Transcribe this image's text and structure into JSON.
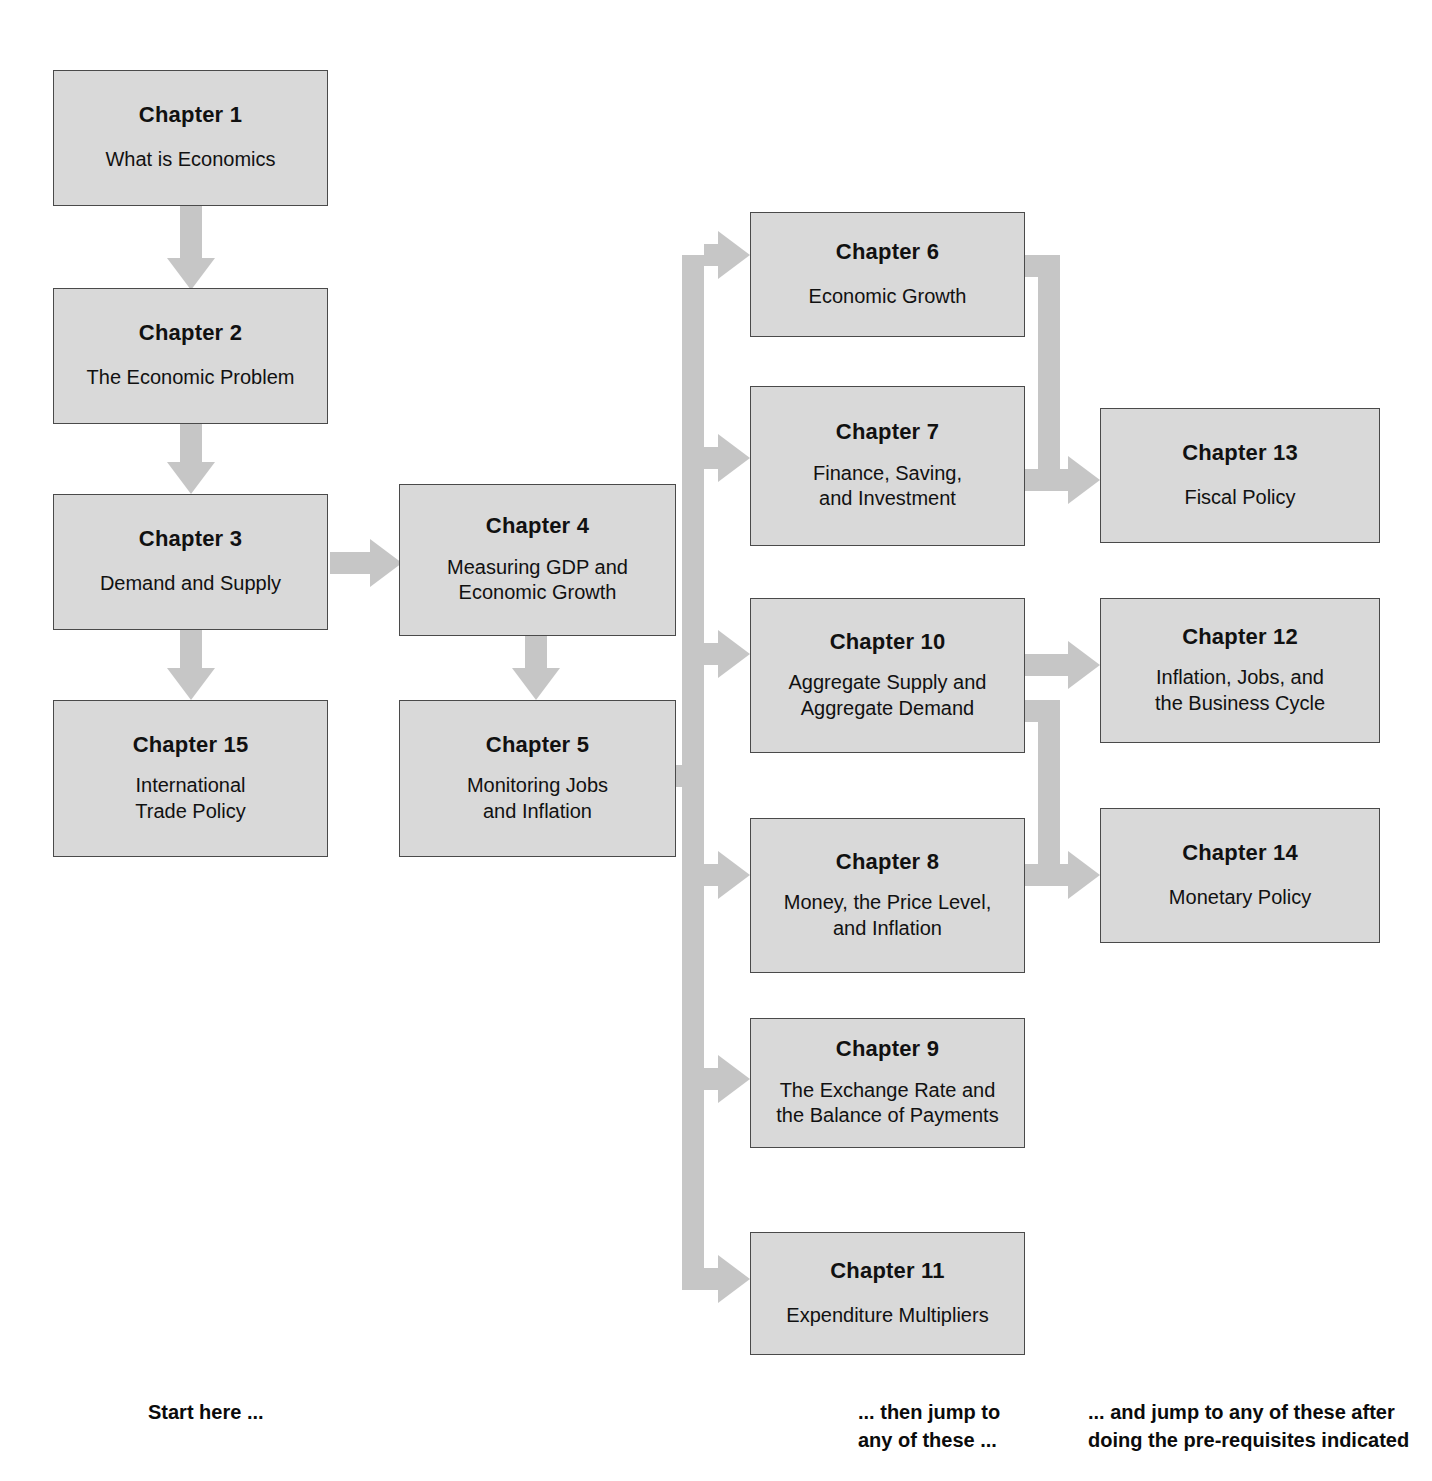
{
  "figure": {
    "type": "flowchart",
    "box_fill": "#d9d9d9",
    "box_border": "#4a4a4a",
    "arrow_color": "#c6c6c6",
    "background": "#ffffff"
  },
  "nodes": [
    {
      "id": "ch1",
      "title": "Chapter 1",
      "subtitle": "What is Economics"
    },
    {
      "id": "ch2",
      "title": "Chapter 2",
      "subtitle": "The Economic Problem"
    },
    {
      "id": "ch3",
      "title": "Chapter 3",
      "subtitle": "Demand and Supply"
    },
    {
      "id": "ch15",
      "title": "Chapter 15",
      "subtitle": "International\nTrade Policy"
    },
    {
      "id": "ch4",
      "title": "Chapter 4",
      "subtitle": "Measuring GDP and\nEconomic Growth"
    },
    {
      "id": "ch5",
      "title": "Chapter 5",
      "subtitle": "Monitoring Jobs\nand Inflation"
    },
    {
      "id": "ch6",
      "title": "Chapter 6",
      "subtitle": "Economic Growth"
    },
    {
      "id": "ch7",
      "title": "Chapter 7",
      "subtitle": "Finance, Saving,\nand Investment"
    },
    {
      "id": "ch10",
      "title": "Chapter 10",
      "subtitle": "Aggregate Supply and\nAggregate Demand"
    },
    {
      "id": "ch8",
      "title": "Chapter 8",
      "subtitle": "Money, the Price Level,\nand Inflation"
    },
    {
      "id": "ch9",
      "title": "Chapter 9",
      "subtitle": "The Exchange Rate and\nthe Balance of Payments"
    },
    {
      "id": "ch11",
      "title": "Chapter 11",
      "subtitle": "Expenditure Multipliers"
    },
    {
      "id": "ch13",
      "title": "Chapter 13",
      "subtitle": "Fiscal Policy"
    },
    {
      "id": "ch12",
      "title": "Chapter 12",
      "subtitle": "Inflation, Jobs, and\nthe Business Cycle"
    },
    {
      "id": "ch14",
      "title": "Chapter 14",
      "subtitle": "Monetary Policy"
    }
  ],
  "edges": [
    {
      "from": "ch1",
      "to": "ch2",
      "direction": "down"
    },
    {
      "from": "ch2",
      "to": "ch3",
      "direction": "down"
    },
    {
      "from": "ch3",
      "to": "ch15",
      "direction": "down"
    },
    {
      "from": "ch3",
      "to": "ch4",
      "direction": "right"
    },
    {
      "from": "ch4",
      "to": "ch5",
      "direction": "down"
    },
    {
      "from": "ch5",
      "to": "ch6",
      "direction": "right-branch"
    },
    {
      "from": "ch5",
      "to": "ch7",
      "direction": "right-branch"
    },
    {
      "from": "ch5",
      "to": "ch10",
      "direction": "right-branch"
    },
    {
      "from": "ch5",
      "to": "ch8",
      "direction": "right-branch"
    },
    {
      "from": "ch5",
      "to": "ch9",
      "direction": "right-branch"
    },
    {
      "from": "ch5",
      "to": "ch11",
      "direction": "right-branch"
    },
    {
      "from": "ch6",
      "to": "ch13",
      "direction": "right-merge"
    },
    {
      "from": "ch7",
      "to": "ch13",
      "direction": "right-merge"
    },
    {
      "from": "ch10",
      "to": "ch12",
      "direction": "right"
    },
    {
      "from": "ch10",
      "to": "ch14",
      "direction": "right-merge"
    },
    {
      "from": "ch8",
      "to": "ch14",
      "direction": "right-merge"
    }
  ],
  "captions": {
    "start": "Start here ...",
    "middle": "... then jump to\nany of these ...",
    "right": "... and jump to any of these after\ndoing the pre-requisites indicated"
  }
}
